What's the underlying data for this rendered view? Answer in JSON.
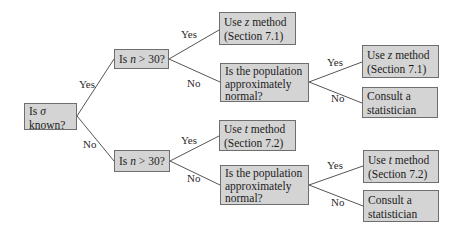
{
  "diagram": {
    "type": "decision-tree",
    "nodes": {
      "root": {
        "line1_pre": "Is ",
        "line1_sym": "σ",
        "line2": "known?"
      },
      "q_n_top": {
        "pre": "Is ",
        "var": "n",
        "post": " > 30?"
      },
      "q_n_bottom": {
        "pre": "Is ",
        "var": "n",
        "post": " > 30?"
      },
      "use_z_top": {
        "line1_pre": "Use ",
        "line1_var": "z",
        "line1_post": " method",
        "line2": "(Section 7.1)"
      },
      "normal_top": {
        "line1": "Is the population",
        "line2": "approximately",
        "line3": "normal?"
      },
      "use_t_mid": {
        "line1_pre": "Use ",
        "line1_var": "t",
        "line1_post": " method",
        "line2": "(Section 7.2)"
      },
      "normal_bottom": {
        "line1": "Is the population",
        "line2": "approximately",
        "line3": "normal?"
      },
      "use_z_right": {
        "line1_pre": "Use ",
        "line1_var": "z",
        "line1_post": " method",
        "line2": "(Section 7.1)"
      },
      "consult_top": {
        "line1": "Consult a",
        "line2": "statistician"
      },
      "use_t_right": {
        "line1_pre": "Use ",
        "line1_var": "t",
        "line1_post": " method",
        "line2": "(Section 7.2)"
      },
      "consult_bottom": {
        "line1": "Consult a",
        "line2": "statistician"
      }
    },
    "edge_labels": {
      "root_yes": "Yes",
      "root_no": "No",
      "ntop_yes": "Yes",
      "ntop_no": "No",
      "nbot_yes": "Yes",
      "nbot_no": "No",
      "normtop_yes": "Yes",
      "normtop_no": "No",
      "normbot_yes": "Yes",
      "normbot_no": "No"
    },
    "colors": {
      "box_fill": "#d4d4d4",
      "box_border": "#6e6e6e",
      "line": "#555555",
      "background": "#ffffff"
    }
  }
}
